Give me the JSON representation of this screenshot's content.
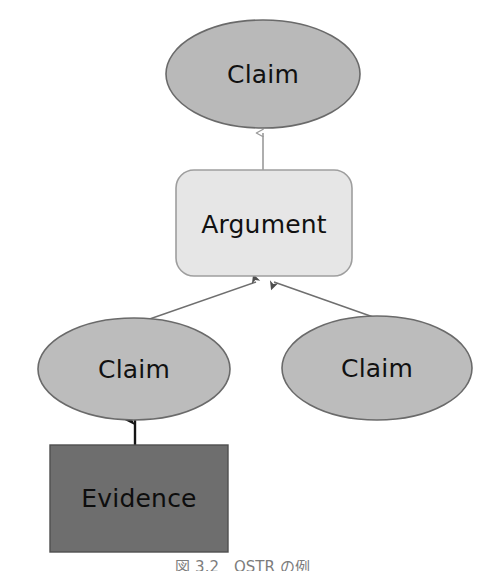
{
  "diagram": {
    "background_color": "#ffffff",
    "nodes": [
      {
        "id": "claim-top",
        "label": "Claim",
        "shape": "ellipse",
        "fill": "#b9b9b9",
        "stroke": "#6a6a6a",
        "cx": 263,
        "cy": 74,
        "rx": 97,
        "ry": 54
      },
      {
        "id": "argument",
        "label": "Argument",
        "shape": "rounded-rect",
        "fill": "#e6e6e6",
        "stroke": "#9a9a9a",
        "x": 176,
        "y": 170,
        "w": 176,
        "h": 106,
        "r": 18
      },
      {
        "id": "claim-left",
        "label": "Claim",
        "shape": "ellipse",
        "fill": "#bcbcbc",
        "stroke": "#6a6a6a",
        "cx": 134,
        "cy": 369,
        "rx": 96,
        "ry": 51
      },
      {
        "id": "claim-right",
        "label": "Claim",
        "shape": "ellipse",
        "fill": "#bcbcbc",
        "stroke": "#6a6a6a",
        "cx": 377,
        "cy": 368,
        "rx": 95,
        "ry": 52
      },
      {
        "id": "evidence",
        "label": "Evidence",
        "shape": "rect",
        "fill": "#6e6e6e",
        "stroke": "#4a4a4a",
        "x": 50,
        "y": 445,
        "w": 178,
        "h": 107
      }
    ],
    "edges": [
      {
        "id": "argument-to-claim-top",
        "from": "argument",
        "to": "claim-top",
        "color": "#9a9a9a",
        "arrowhead": "open-up",
        "x1": 263,
        "y1": 170,
        "x2": 263,
        "y2": 128
      },
      {
        "id": "claim-left-to-argument",
        "from": "claim-left",
        "to": "argument",
        "color": "#6a6a6a",
        "arrowhead": "filled-up",
        "x1": 141,
        "y1": 320,
        "x2": 258,
        "y2": 278
      },
      {
        "id": "claim-right-to-argument",
        "from": "claim-right",
        "to": "argument",
        "color": "#6a6a6a",
        "arrowhead": "filled-up",
        "x1": 375,
        "y1": 316,
        "x2": 272,
        "y2": 278
      },
      {
        "id": "evidence-to-claim-left",
        "from": "evidence",
        "to": "claim-left",
        "color": "#151515",
        "arrowhead": "filled-up",
        "x1": 135,
        "y1": 445,
        "x2": 135,
        "y2": 414
      }
    ]
  },
  "caption": {
    "text": "図 3.2　OSTR の例"
  }
}
